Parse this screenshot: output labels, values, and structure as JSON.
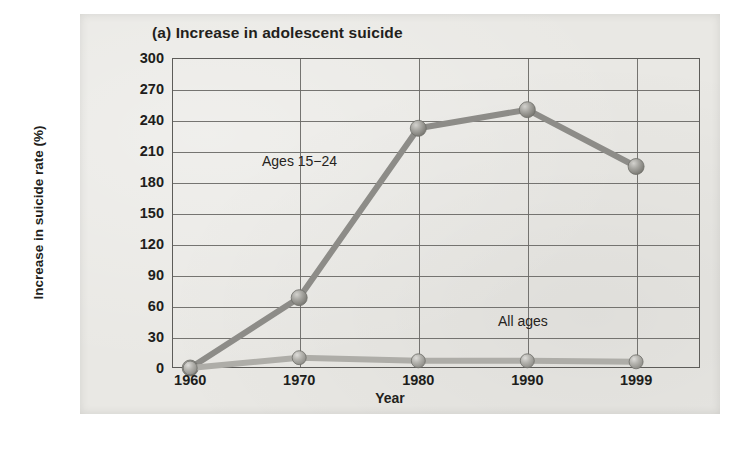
{
  "figure": {
    "title": "(a) Increase in adolescent suicide",
    "xlabel": "Year",
    "ylabel": "Increase in suicide rate (%)"
  },
  "annotations": {
    "series_a": "Ages 15−24",
    "series_b": "All ages"
  },
  "axis": {
    "y_ticks": [
      "0",
      "30",
      "60",
      "90",
      "120",
      "150",
      "180",
      "210",
      "240",
      "270",
      "300"
    ],
    "x_ticks": [
      "1960",
      "1970",
      "1980",
      "1990",
      "1999"
    ]
  },
  "colors": {
    "page": "#e9e8e4",
    "ink": "#231f1c",
    "grid": "#6a6966",
    "frame": "#5d5c59",
    "series_a_line": "#8d8c88",
    "series_b_line": "#a9a8a3",
    "marker": "#9b9a95"
  },
  "chart_data": {
    "type": "line",
    "title": "(a) Increase in adolescent suicide",
    "xlabel": "Year",
    "ylabel": "Increase in suicide rate (%)",
    "x": [
      1960,
      1970,
      1980,
      1990,
      1999
    ],
    "x_tick_labels": [
      "1960",
      "1970",
      "1980",
      "1990",
      "1999"
    ],
    "ylim": [
      0,
      300
    ],
    "y_ticks": [
      0,
      30,
      60,
      90,
      120,
      150,
      180,
      210,
      240,
      270,
      300
    ],
    "grid": true,
    "legend": "inline-annotations",
    "series": [
      {
        "name": "Ages 15−24",
        "values": [
          0,
          68,
          232,
          250,
          195
        ]
      },
      {
        "name": "All ages",
        "values": [
          0,
          10,
          7,
          7,
          6
        ]
      }
    ]
  }
}
